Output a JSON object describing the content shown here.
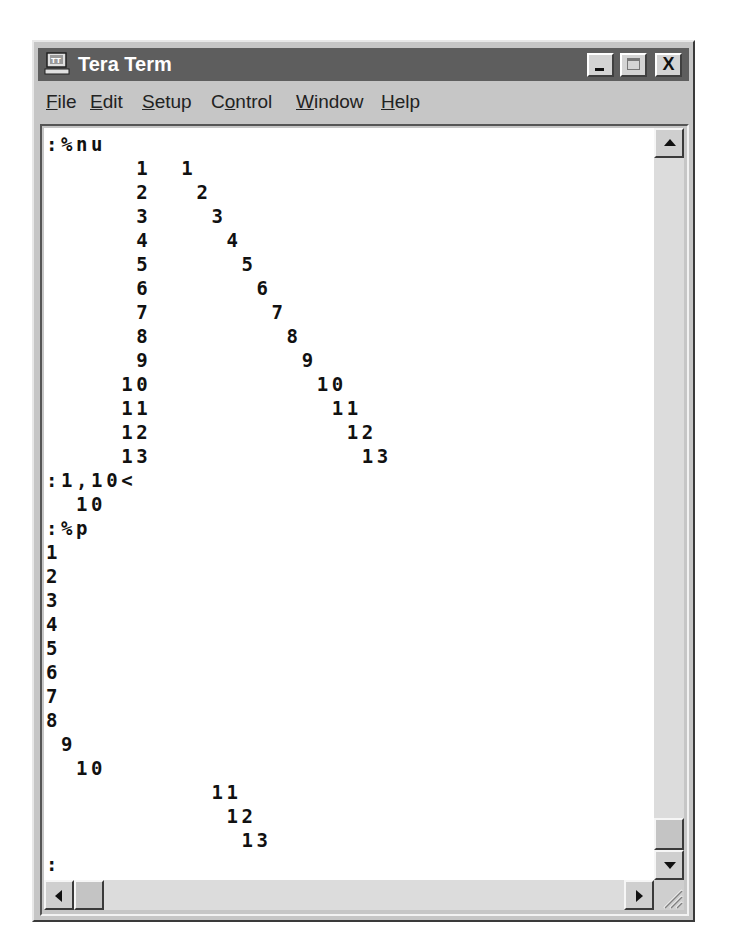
{
  "window": {
    "title": "Tera Term",
    "controls": {
      "minimize": "_",
      "maximize": "□",
      "close": "X"
    }
  },
  "menu": {
    "items": [
      {
        "label": "File",
        "accel": "F",
        "rest": "ile"
      },
      {
        "label": "Edit",
        "accel": "E",
        "rest": "dit"
      },
      {
        "label": "Setup",
        "accel": "S",
        "rest": "etup"
      },
      {
        "label": "Control",
        "pre": "C",
        "accel": "o",
        "rest": "ntrol"
      },
      {
        "label": "Window",
        "accel": "W",
        "rest": "indow"
      },
      {
        "label": "Help",
        "accel": "H",
        "rest": "elp"
      }
    ]
  },
  "terminal": {
    "lines": [
      ":%nu",
      "      1  1",
      "      2   2",
      "      3    3",
      "      4     4",
      "      5      5",
      "      6       6",
      "      7        7",
      "      8         8",
      "      9          9",
      "     10           10",
      "     11            11",
      "     12             12",
      "     13              13",
      ":1,10<",
      "  10",
      ":%p",
      "1",
      "2",
      "3",
      "4",
      "5",
      "6",
      "7",
      "8",
      " 9",
      "  10",
      "           11",
      "            12",
      "             13",
      ":"
    ]
  },
  "scrollbars": {
    "vertical": {
      "up": "up-arrow",
      "down": "down-arrow",
      "position": "bottom"
    },
    "horizontal": {
      "left": "left-arrow",
      "right": "right-arrow",
      "position": "left"
    }
  }
}
